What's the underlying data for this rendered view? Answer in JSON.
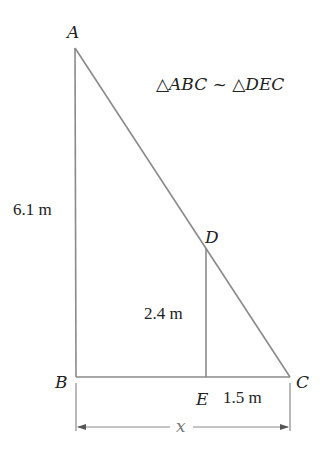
{
  "diagram": {
    "similarity_statement": "△ABC ~ △DEC",
    "points": {
      "A": {
        "label": "A",
        "x": 75,
        "y": 48
      },
      "B": {
        "label": "B",
        "x": 76,
        "y": 377
      },
      "C": {
        "label": "C",
        "x": 290,
        "y": 377
      },
      "D": {
        "label": "D",
        "x": 206,
        "y": 248
      },
      "E": {
        "label": "E",
        "x": 206,
        "y": 377
      }
    },
    "measurements": {
      "AB": "6.1 m",
      "DE": "2.4 m",
      "EC": "1.5 m",
      "BC": "x"
    },
    "colors": {
      "line": "#8a8a8a",
      "text": "#222222",
      "background": "#ffffff"
    }
  }
}
